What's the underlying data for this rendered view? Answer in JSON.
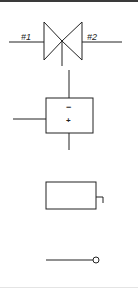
{
  "symbols": {
    "valve": {
      "port_left_label": "#1",
      "port_right_label": "#2"
    },
    "amplifier_box": {
      "top_sign": "−",
      "bottom_sign": "+"
    },
    "terminal_box": {},
    "terminal_line": {}
  },
  "colors": {
    "stroke": "#222222",
    "background": "#ffffff",
    "top_border": "#3a3a3a"
  }
}
